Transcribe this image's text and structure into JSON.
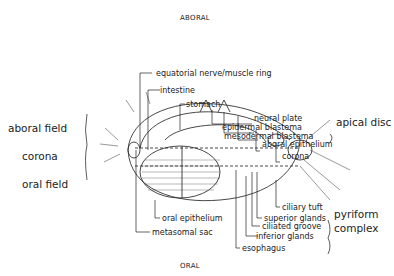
{
  "axis": {
    "top": "ABORAL",
    "bottom": "ORAL"
  },
  "left_regions": [
    {
      "label": "aboral field"
    },
    {
      "label": "corona"
    },
    {
      "label": "oral field"
    }
  ],
  "labels": {
    "equatorial_ring": "equatorial nerve/muscle ring",
    "intestine": "intestine",
    "stomach": "stomach",
    "neural_plate": "neural plate",
    "epidermal_blastema": "epidermal blastema",
    "mesodermal_blastema": "mesodermal blastema",
    "aboral_epithelium": "aboral epithelium",
    "corona": "corona",
    "ciliary_tuft": "ciliary tuft",
    "superior_glands": "superior glands",
    "ciliated_groove": "ciliated groove",
    "inferior_glands": "inferior glands",
    "esophagus": "esophagus",
    "oral_epithelium": "oral epithelium",
    "metasomal_sac": "metasomal sac"
  },
  "groups": {
    "apical_disc": "apical disc",
    "pyriform_1": "pyriform",
    "pyriform_2": "complex"
  }
}
